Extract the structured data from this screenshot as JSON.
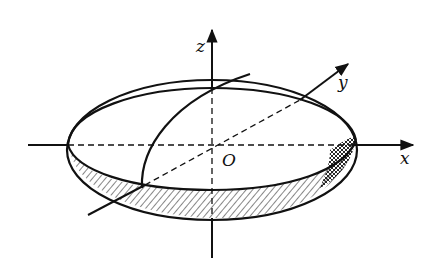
{
  "figure": {
    "type": "ellipsoid with coordinate axes",
    "axes": {
      "x_label": "x",
      "y_label": "y",
      "z_label": "z",
      "origin_label": "O"
    },
    "colors": {
      "ink": "#111111",
      "background": "#ffffff"
    }
  }
}
